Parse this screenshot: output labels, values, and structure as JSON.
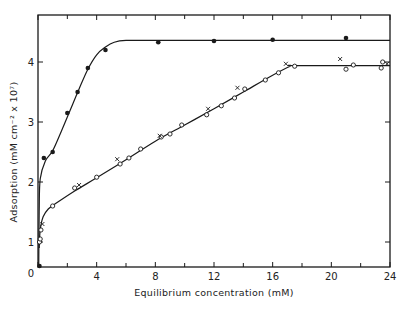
{
  "chart_data": {
    "type": "scatter",
    "title": "",
    "xlabel": "Equilibrium concentration  (mM)",
    "ylabel": "Adsorption  (mM cm⁻² x 10⁷)",
    "xlim": [
      0,
      24
    ],
    "ylim": [
      0.58,
      4.65
    ],
    "xticks": [
      0,
      4,
      8,
      12,
      16,
      20,
      24
    ],
    "xticks_minor": [
      2,
      6,
      10,
      14,
      18,
      22
    ],
    "yticks": [
      1,
      2,
      3,
      4
    ],
    "origin_label": "0",
    "grid": false,
    "legend": null,
    "series": [
      {
        "name": "filled circles",
        "marker": "filled-circle",
        "points": [
          [
            0.1,
            0.6
          ],
          [
            0.4,
            2.4
          ],
          [
            1.0,
            2.5
          ],
          [
            2.0,
            3.15
          ],
          [
            2.7,
            3.5
          ],
          [
            3.4,
            3.9
          ],
          [
            4.6,
            4.2
          ],
          [
            8.2,
            4.33
          ],
          [
            12.0,
            4.35
          ],
          [
            16.0,
            4.37
          ],
          [
            21.0,
            4.4
          ]
        ],
        "curve": [
          [
            0.05,
            0.6
          ],
          [
            0.08,
            1.5
          ],
          [
            0.15,
            2.05
          ],
          [
            0.5,
            2.35
          ],
          [
            1.0,
            2.52
          ],
          [
            1.6,
            2.85
          ],
          [
            2.2,
            3.2
          ],
          [
            2.8,
            3.55
          ],
          [
            3.4,
            3.88
          ],
          [
            4.0,
            4.12
          ],
          [
            4.6,
            4.25
          ],
          [
            5.2,
            4.33
          ],
          [
            6.0,
            4.36
          ],
          [
            8.0,
            4.36
          ],
          [
            24.0,
            4.36
          ]
        ]
      },
      {
        "name": "open circles",
        "marker": "open-circle",
        "points": [
          [
            0.1,
            1.0
          ],
          [
            0.15,
            1.05
          ],
          [
            0.2,
            1.2
          ],
          [
            1.0,
            1.6
          ],
          [
            2.5,
            1.9
          ],
          [
            4.0,
            2.08
          ],
          [
            5.6,
            2.3
          ],
          [
            6.2,
            2.4
          ],
          [
            7.0,
            2.55
          ],
          [
            8.4,
            2.75
          ],
          [
            9.0,
            2.8
          ],
          [
            9.8,
            2.95
          ],
          [
            11.5,
            3.12
          ],
          [
            12.5,
            3.27
          ],
          [
            13.4,
            3.4
          ],
          [
            14.1,
            3.55
          ],
          [
            15.5,
            3.7
          ],
          [
            16.4,
            3.82
          ],
          [
            17.5,
            3.93
          ],
          [
            21.0,
            3.88
          ],
          [
            21.5,
            3.95
          ],
          [
            23.4,
            3.9
          ],
          [
            23.5,
            4.0
          ]
        ],
        "curve": [
          [
            0.08,
            0.9
          ],
          [
            0.15,
            1.2
          ],
          [
            0.35,
            1.42
          ],
          [
            0.7,
            1.55
          ],
          [
            1.2,
            1.64
          ],
          [
            2.5,
            1.85
          ],
          [
            4.0,
            2.07
          ],
          [
            6.0,
            2.37
          ],
          [
            8.0,
            2.68
          ],
          [
            10.0,
            2.95
          ],
          [
            12.0,
            3.22
          ],
          [
            14.0,
            3.5
          ],
          [
            16.0,
            3.78
          ],
          [
            17.2,
            3.93
          ],
          [
            17.6,
            3.94
          ],
          [
            24.0,
            3.94
          ]
        ]
      },
      {
        "name": "crosses",
        "marker": "cross",
        "points": [
          [
            0.3,
            1.3
          ],
          [
            2.8,
            1.95
          ],
          [
            5.4,
            2.38
          ],
          [
            8.3,
            2.77
          ],
          [
            11.6,
            3.22
          ],
          [
            13.6,
            3.57
          ],
          [
            16.9,
            3.97
          ],
          [
            20.6,
            4.05
          ],
          [
            23.8,
            3.97
          ]
        ]
      }
    ]
  },
  "colors": {
    "ink": "#1a1a1a",
    "background": "#ffffff"
  }
}
